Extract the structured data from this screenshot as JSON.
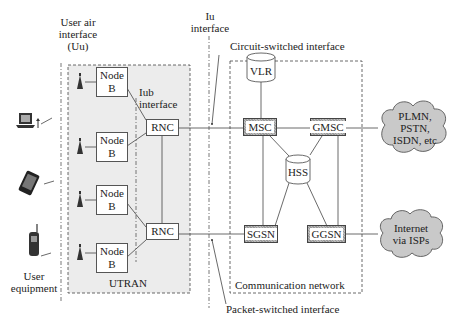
{
  "diagram": {
    "labels": {
      "uu": [
        "User air",
        "interface",
        "(Uu)"
      ],
      "iu": [
        "Iu",
        "interface"
      ],
      "iub": [
        "Iub",
        "interface"
      ],
      "circuit_switched": "Circuit-switched interface",
      "packet_switched": "Packet-switched interface",
      "user_equipment": [
        "User",
        "equipment"
      ],
      "utran": "UTRAN",
      "communication_network": "Communication network"
    },
    "node_b": [
      {
        "line1": "Node",
        "line2": "B"
      },
      {
        "line1": "Node",
        "line2": "B"
      },
      {
        "line1": "Node",
        "line2": "B"
      },
      {
        "line1": "Node",
        "line2": "B"
      }
    ],
    "rnc": [
      "RNC",
      "RNC"
    ],
    "core": {
      "vlr": "VLR",
      "msc": "MSC",
      "gmsc": "GMSC",
      "hss": "HSS",
      "sgsn": "SGSN",
      "ggsn": "GGSN"
    },
    "clouds": {
      "pstn": [
        "PLMN,",
        "PSTN,",
        "ISDN, etc"
      ],
      "internet": [
        "Internet",
        "via ISPs"
      ]
    },
    "devices": [
      "laptop",
      "smartphone",
      "mobile-phone"
    ]
  }
}
